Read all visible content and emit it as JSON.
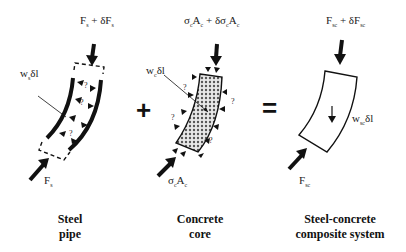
{
  "figure": {
    "panels": [
      {
        "id": "steel-pipe",
        "caption_line1": "Steel",
        "caption_line2": "pipe",
        "top_force": "F_s + δF_s",
        "bottom_force": "F_s",
        "weight": "w_s δl",
        "unknown_marker": "?"
      },
      {
        "id": "concrete-core",
        "caption_line1": "Concrete",
        "caption_line2": "core",
        "top_force": "σ_c A_c + δσ_c A_c",
        "bottom_force": "σ_c A_c",
        "weight": "w_c δl",
        "unknown_marker": "?"
      },
      {
        "id": "composite",
        "caption_line1": "Steel-concrete",
        "caption_line2": "composite system",
        "top_force": "F_sc + δF_sc",
        "bottom_force": "F_sc",
        "weight": "w_sc δl"
      }
    ],
    "operators": {
      "plus": "+",
      "equals": "="
    }
  },
  "labels": {
    "p1_top_main": "F",
    "p1_top_sub": "s",
    "p1_top_mid": " + δF",
    "p1_top_sub2": "s",
    "p1_w_main": "w",
    "p1_w_sub": "s",
    "p1_w_tail": "δl",
    "p1_bot_main": "F",
    "p1_bot_sub": "s",
    "p2_top_main": "σ",
    "p2_top_sub": "c",
    "p2_top_a": "A",
    "p2_top_sub2": "c",
    "p2_top_mid": " + δσ",
    "p2_top_sub3": "c",
    "p2_top_b": "A",
    "p2_top_sub4": "c",
    "p2_w_main": "w",
    "p2_w_sub": "c",
    "p2_w_tail": "δl",
    "p2_bot_main": "σ",
    "p2_bot_sub": "c",
    "p2_bot_a": "A",
    "p2_bot_sub2": "c",
    "p3_top_main": "F",
    "p3_top_sub": "sc",
    "p3_top_mid": " + δF",
    "p3_top_sub2": "sc",
    "p3_w_main": "w",
    "p3_w_sub": "sc",
    "p3_w_tail": "δl",
    "p3_bot_main": "F",
    "p3_bot_sub": "sc",
    "q": "?"
  }
}
